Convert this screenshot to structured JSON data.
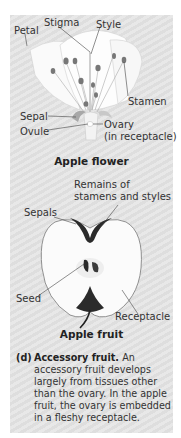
{
  "flower": {
    "title": "Apple flower",
    "labels": {
      "petal": "Petal",
      "stigma": "Stigma",
      "style": "Style",
      "stamen": "Stamen",
      "sepal": "Sepal",
      "ovule": "Ovule",
      "ovary": "Ovary",
      "ovary_note": "(in receptacle)"
    }
  },
  "fruit": {
    "title": "Apple fruit",
    "labels": {
      "remains_line1": "Remains of",
      "remains_line2": "stamens and styles",
      "sepals": "Sepals",
      "seed": "Seed",
      "receptacle": "Receptacle"
    }
  },
  "caption": {
    "tag": "(d)",
    "heading": "Accessory fruit.",
    "text": "An accessory fruit develops largely from tissues other than the ovary. In the apple fruit, the ovary is embedded in a fleshy receptacle."
  },
  "colors": {
    "panel": "#e4e4e4",
    "text": "#333333",
    "dark_tissue": "#2a2a2a"
  }
}
